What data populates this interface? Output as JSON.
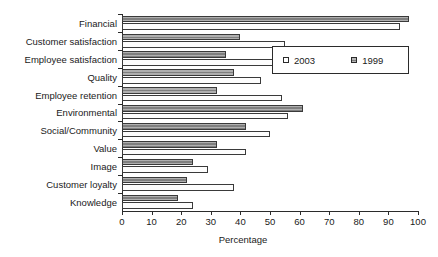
{
  "chart_data": {
    "type": "bar",
    "orientation": "horizontal",
    "title": "",
    "xlabel": "Percentage",
    "ylabel": "",
    "xlim": [
      0,
      100
    ],
    "xticks": [
      0,
      10,
      20,
      30,
      40,
      50,
      60,
      70,
      80,
      90,
      100
    ],
    "grid": false,
    "legend_position": "upper right",
    "categories": [
      "Financial",
      "Customer satisfaction",
      "Employee satisfaction",
      "Quality",
      "Employee retention",
      "Environmental",
      "Social/Community",
      "Value",
      "Image",
      "Customer loyalty",
      "Knowledge"
    ],
    "series": [
      {
        "name": "1999",
        "color": "#8d8d8d",
        "values": [
          97,
          40,
          35,
          38,
          32,
          61,
          42,
          32,
          24,
          22,
          19
        ]
      },
      {
        "name": "2003",
        "color": "#ffffff",
        "values": [
          94,
          55,
          54,
          47,
          54,
          56,
          50,
          42,
          29,
          38,
          24
        ]
      }
    ]
  },
  "legend": {
    "entries": [
      {
        "label": "2003",
        "swatch": "open-square-marker"
      },
      {
        "label": "1999",
        "swatch": "hatched-square-marker"
      }
    ]
  },
  "colors": {
    "axis": "#2b2b2b",
    "text": "#1a1a1a",
    "bar_1999": "#8d8d8d",
    "bar_2003": "#ffffff",
    "background": "#ffffff"
  }
}
